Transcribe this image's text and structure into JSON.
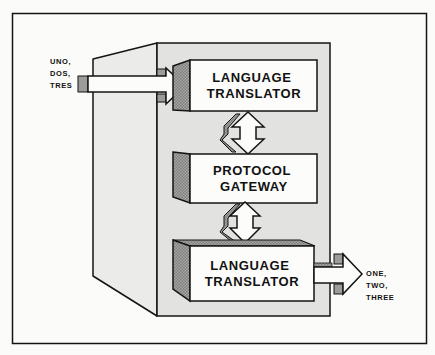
{
  "diagram": {
    "title": "",
    "colors": {
      "background": "#fbfbf9",
      "panel_front": "#e4e4e2",
      "panel_side": "#ebebe9",
      "box_face": "#fcfcfa",
      "hatch": "#9a9a98",
      "outline": "#141414"
    },
    "input": {
      "lines": [
        "UNO,",
        "DOS,",
        "TRES"
      ]
    },
    "output": {
      "lines": [
        "ONE,",
        "TWO,",
        "THREE"
      ]
    },
    "nodes": [
      {
        "id": "translator-top",
        "lines": [
          "LANGUAGE",
          "TRANSLATOR"
        ]
      },
      {
        "id": "protocol-gateway",
        "lines": [
          "PROTOCOL",
          "GATEWAY"
        ]
      },
      {
        "id": "translator-bottom",
        "lines": [
          "LANGUAGE",
          "TRANSLATOR"
        ]
      }
    ],
    "edges": [
      {
        "from": "input",
        "to": "translator-top",
        "type": "arrow"
      },
      {
        "from": "translator-top",
        "to": "protocol-gateway",
        "type": "bidirectional"
      },
      {
        "from": "protocol-gateway",
        "to": "translator-bottom",
        "type": "bidirectional"
      },
      {
        "from": "translator-bottom",
        "to": "output",
        "type": "arrow"
      }
    ]
  }
}
